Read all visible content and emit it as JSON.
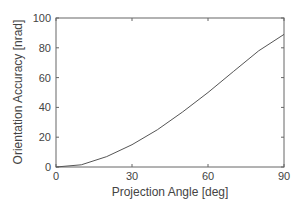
{
  "chart_data": {
    "type": "line",
    "title": "",
    "xlabel": "Projection Angle [deg]",
    "ylabel": "Orientation Accuracy [nrad]",
    "xlim": [
      0,
      90
    ],
    "ylim": [
      0,
      100
    ],
    "xticks": [
      0,
      30,
      60,
      90
    ],
    "yticks": [
      0,
      20,
      40,
      60,
      80,
      100
    ],
    "grid": false,
    "legend": null,
    "series": [
      {
        "name": "Orientation Accuracy",
        "x": [
          0,
          10,
          20,
          30,
          40,
          50,
          60,
          70,
          80,
          90
        ],
        "y": [
          0,
          1.5,
          7,
          15,
          25,
          37,
          50,
          64,
          78,
          89
        ]
      }
    ]
  },
  "colors": {
    "line": "#555555",
    "axes": "#666666"
  }
}
